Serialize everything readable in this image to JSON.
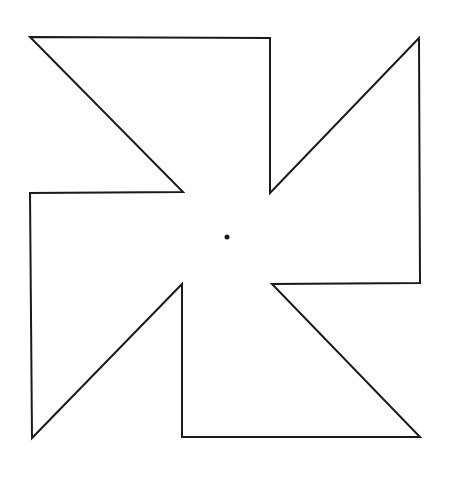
{
  "diagram": {
    "type": "pinwheel-outline",
    "stroke_color": "#1a1a1a",
    "background": "#ffffff",
    "stroke_width": 2,
    "outline_points": [
      [
        30,
        37
      ],
      [
        270,
        38
      ],
      [
        270,
        193
      ],
      [
        419,
        38
      ],
      [
        420,
        283
      ],
      [
        272,
        284
      ],
      [
        420,
        437
      ],
      [
        182,
        437
      ],
      [
        182,
        284
      ],
      [
        32,
        438
      ],
      [
        30,
        193
      ],
      [
        183,
        192
      ]
    ],
    "center_dot": {
      "cx": 227,
      "cy": 237,
      "r": 2.5
    }
  }
}
